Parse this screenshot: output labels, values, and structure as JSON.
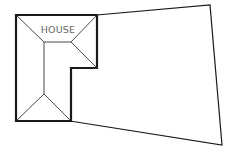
{
  "diagram": {
    "type": "site-plan",
    "house": {
      "label": "HOUSE",
      "outline_color": "#1a1a1a",
      "roof_line_color": "#333333",
      "label_color": "#666666"
    },
    "yard": {
      "outline_color": "#1a1a1a"
    },
    "background": "#ffffff"
  }
}
